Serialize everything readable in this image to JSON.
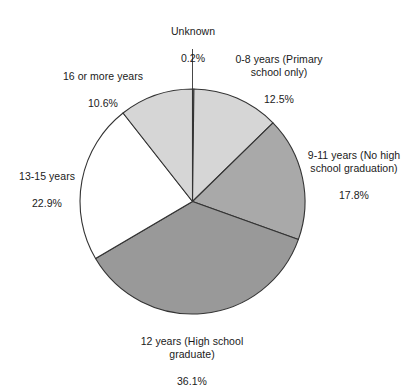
{
  "chart_data": {
    "type": "pie",
    "title": "",
    "subtitle": "",
    "xlabel": "",
    "ylabel": "",
    "legend_position": "none",
    "grid": false,
    "start_angle_deg": 0,
    "direction": "clockwise",
    "units": "percent",
    "categories": [
      "Unknown",
      "0-8 years (Primary school only)",
      "9-11 years (No high school graduation)",
      "12 years (High school graduate)",
      "13-15 years",
      "16 or more years"
    ],
    "values": [
      0.2,
      12.5,
      17.8,
      36.1,
      22.9,
      10.6
    ],
    "value_labels": [
      "0.2%",
      "12.5%",
      "17.8%",
      "36.1%",
      "22.9%",
      "10.6%"
    ],
    "slice_colors": [
      "#ffffff",
      "#d6d6d6",
      "#a9a9a9",
      "#999999",
      "#ffffff",
      "#d6d6d6"
    ],
    "slices": [
      {
        "name": "Unknown",
        "label_lines": "Unknown",
        "percent_label": "0.2%",
        "value": 0.2,
        "color": "#ffffff",
        "has_leader_line": true
      },
      {
        "name": "0-8 years (Primary school only)",
        "label_lines": "0-8 years (Primary\nschool only)",
        "percent_label": "12.5%",
        "value": 12.5,
        "color": "#d6d6d6",
        "has_leader_line": false
      },
      {
        "name": "9-11 years (No high school graduation)",
        "label_lines": "9-11 years (No high\nschool graduation)",
        "percent_label": "17.8%",
        "value": 17.8,
        "color": "#a9a9a9",
        "has_leader_line": false
      },
      {
        "name": "12 years (High school graduate)",
        "label_lines": "12 years (High school\ngraduate)",
        "percent_label": "36.1%",
        "value": 36.1,
        "color": "#999999",
        "has_leader_line": false
      },
      {
        "name": "13-15 years",
        "label_lines": "13-15 years",
        "percent_label": "22.9%",
        "value": 22.9,
        "color": "#ffffff",
        "has_leader_line": false
      },
      {
        "name": "16 or more years",
        "label_lines": "16 or more years",
        "percent_label": "10.6%",
        "value": 10.6,
        "color": "#d6d6d6",
        "has_leader_line": false
      }
    ],
    "outline_color": "#333333",
    "total": 100.1
  }
}
